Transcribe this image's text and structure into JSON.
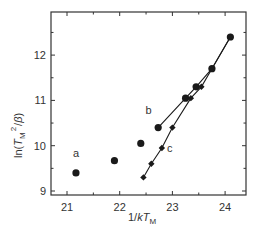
{
  "chart_data": {
    "type": "scatter",
    "title": "",
    "xlabel": "1/kT_M",
    "ylabel": "ln(T_M^2/β)",
    "xlim": [
      20.7,
      24.4
    ],
    "ylim": [
      8.7,
      12.7
    ],
    "x_ticks": [
      21,
      22,
      23,
      24
    ],
    "y_ticks": [
      9,
      10,
      11,
      12
    ],
    "grid": false,
    "legend": "none (inline labels a, b, c)",
    "series": [
      {
        "name": "a",
        "marker": "circle",
        "line": false,
        "x": [
          21.17,
          21.9,
          22.4
        ],
        "y": [
          9.4,
          9.67,
          10.05
        ]
      },
      {
        "name": "b",
        "marker": "circle",
        "line": true,
        "x": [
          22.73,
          23.25,
          23.45,
          23.75,
          24.1
        ],
        "y": [
          10.4,
          11.05,
          11.3,
          11.7,
          12.4
        ]
      },
      {
        "name": "c",
        "marker": "diamond",
        "line": true,
        "x": [
          22.45,
          22.6,
          22.8,
          23.0,
          23.35,
          23.55,
          23.75,
          24.1
        ],
        "y": [
          9.3,
          9.6,
          9.95,
          10.4,
          11.05,
          11.3,
          11.7,
          12.4
        ]
      }
    ],
    "annotations": [
      {
        "text": "a",
        "x": 21.17,
        "y": 9.75
      },
      {
        "text": "b",
        "x": 22.55,
        "y": 10.7
      },
      {
        "text": "c",
        "x": 22.95,
        "y": 9.85
      }
    ]
  },
  "axes": {
    "x_tick_labels": [
      "21",
      "22",
      "23",
      "24"
    ],
    "y_tick_labels": [
      "9",
      "10",
      "11",
      "12"
    ],
    "xlabel_main": "1/",
    "xlabel_k": "k",
    "xlabel_T": "T",
    "xlabel_sub": "M",
    "ylabel_ln": "ln(",
    "ylabel_T": "T",
    "ylabel_sub": "M",
    "ylabel_sup": "2",
    "ylabel_tail": "/",
    "ylabel_beta": "β",
    "ylabel_close": ")"
  },
  "colors": {
    "ink": "#1a1a1a",
    "frame": "#333333"
  }
}
